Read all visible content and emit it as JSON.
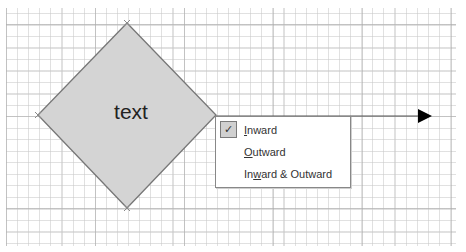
{
  "canvas": {
    "background": "#ffffff",
    "grid": "dotted drawing grid"
  },
  "shape": {
    "type": "diamond",
    "label": "text",
    "fill": "#d4d4d4",
    "stroke": "#777777"
  },
  "connector": {
    "type": "line-with-arrow",
    "arrowhead_color": "#000000",
    "direction": "right"
  },
  "context_menu": {
    "items": [
      {
        "label": "Inward",
        "mnemonic": "I",
        "checked": true,
        "check_icon": "✓"
      },
      {
        "label": "Outward",
        "mnemonic": "O",
        "checked": false
      },
      {
        "label": "Inward & Outward",
        "mnemonic": "w",
        "checked": false
      }
    ]
  }
}
